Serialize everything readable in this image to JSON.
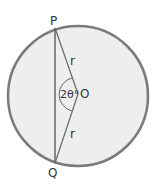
{
  "diagram": {
    "labels": {
      "P": "P",
      "Q": "Q",
      "O": "O",
      "r_top": "r",
      "r_bottom": "r",
      "angle": "2θ°"
    },
    "colors": {
      "circle_fill": "#eeeeee",
      "circle_stroke": "#777777",
      "line_stroke": "#666666"
    }
  }
}
